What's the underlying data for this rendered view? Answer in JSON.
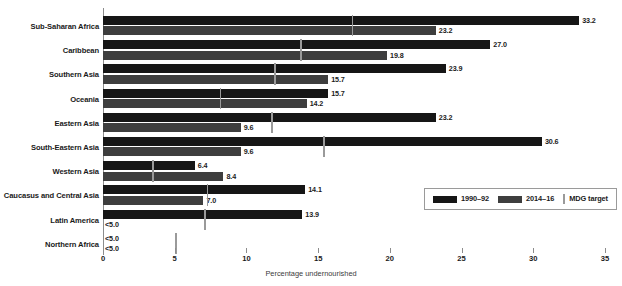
{
  "chart_data": {
    "type": "bar",
    "orientation": "horizontal",
    "title": "",
    "xlabel": "Percentage undernourished",
    "ylabel": "",
    "xlim": [
      0,
      35
    ],
    "xticks": [
      "0",
      "5",
      "10",
      "15",
      "20",
      "25",
      "30",
      "35"
    ],
    "grid": false,
    "legend_position": "inside-bottom-right",
    "categories": [
      "Sub-Saharan Africa",
      "Caribbean",
      "Southern Asia",
      "Oceania",
      "Eastern Asia",
      "South-Eastern Asia",
      "Western Asia",
      "Caucasus and Central Asia",
      "Latin America",
      "Northern Africa"
    ],
    "series": [
      {
        "name": "1990–92",
        "color": "#161616",
        "values": [
          33.2,
          27.0,
          23.9,
          15.7,
          23.2,
          30.6,
          6.4,
          14.1,
          13.9,
          4.5
        ],
        "labels": [
          "33.2",
          "27.0",
          "23.9",
          "15.7",
          "23.2",
          "30.6",
          "6.4",
          "14.1",
          "13.9",
          "<5.0"
        ],
        "censored": [
          false,
          false,
          false,
          false,
          false,
          false,
          false,
          false,
          false,
          true
        ]
      },
      {
        "name": "2014–16",
        "color": "#3e3e3e",
        "values": [
          23.2,
          19.8,
          15.7,
          14.2,
          9.6,
          9.6,
          8.4,
          7.0,
          4.5,
          4.5
        ],
        "labels": [
          "23.2",
          "19.8",
          "15.7",
          "14.2",
          "9.6",
          "9.6",
          "8.4",
          "7.0",
          "<5.0",
          "<5.0"
        ],
        "censored": [
          false,
          false,
          false,
          false,
          false,
          false,
          false,
          false,
          true,
          true
        ]
      }
    ],
    "markers": {
      "name": "MDG target",
      "color": "#9a9a9a",
      "values": [
        17.4,
        13.8,
        12.0,
        8.2,
        11.8,
        15.4,
        3.5,
        7.3,
        7.1,
        5.1
      ]
    }
  },
  "legend": {
    "items": [
      {
        "label": "1990–92",
        "swatch": "bar-dark"
      },
      {
        "label": "2014–16",
        "swatch": "bar-gray"
      },
      {
        "label": "MDG target",
        "swatch": "tick-marker"
      }
    ]
  }
}
